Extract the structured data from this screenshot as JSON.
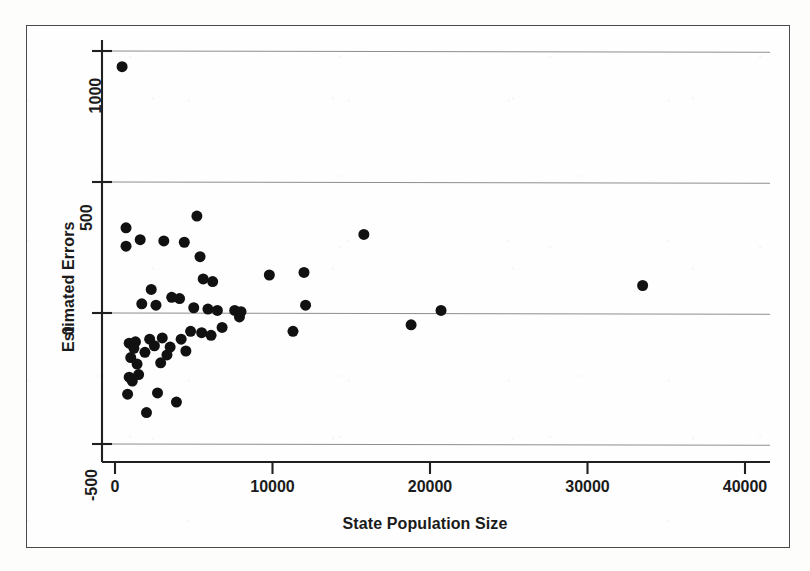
{
  "chart_data": {
    "type": "scatter",
    "title": "",
    "xlabel": "State Population Size",
    "ylabel": "Estimated Errors",
    "xlim": [
      -500,
      41000
    ],
    "ylim": [
      -600,
      1060
    ],
    "xticks": [
      0,
      10000,
      20000,
      30000,
      40000
    ],
    "xtick_labels": [
      "0",
      "10000",
      "20000",
      "30000",
      "40000"
    ],
    "yticks": [
      -500,
      0,
      500,
      1000
    ],
    "ytick_labels": [
      "-500",
      "0",
      "500",
      "1000"
    ],
    "grid": "horizontal",
    "legend": "none",
    "marker": "filled-circle",
    "marker_color": "#111111",
    "marker_size_px": 11,
    "points": [
      {
        "x": 450,
        "y": 940
      },
      {
        "x": 700,
        "y": 325
      },
      {
        "x": 700,
        "y": 255
      },
      {
        "x": 1600,
        "y": 280
      },
      {
        "x": 3100,
        "y": 275
      },
      {
        "x": 4400,
        "y": 270
      },
      {
        "x": 5200,
        "y": 370
      },
      {
        "x": 5400,
        "y": 215
      },
      {
        "x": 15800,
        "y": 300
      },
      {
        "x": 33500,
        "y": 105
      },
      {
        "x": 5600,
        "y": 130
      },
      {
        "x": 6200,
        "y": 120
      },
      {
        "x": 9800,
        "y": 145
      },
      {
        "x": 12000,
        "y": 155
      },
      {
        "x": 2300,
        "y": 90
      },
      {
        "x": 3600,
        "y": 60
      },
      {
        "x": 4100,
        "y": 55
      },
      {
        "x": 1700,
        "y": 35
      },
      {
        "x": 2600,
        "y": 30
      },
      {
        "x": 5000,
        "y": 20
      },
      {
        "x": 5900,
        "y": 15
      },
      {
        "x": 6500,
        "y": 10
      },
      {
        "x": 7600,
        "y": 10
      },
      {
        "x": 7900,
        "y": -15
      },
      {
        "x": 8000,
        "y": 5
      },
      {
        "x": 12100,
        "y": 30
      },
      {
        "x": 18800,
        "y": -45
      },
      {
        "x": 20700,
        "y": 10
      },
      {
        "x": 11300,
        "y": -70
      },
      {
        "x": 900,
        "y": -115
      },
      {
        "x": 1300,
        "y": -110
      },
      {
        "x": 1200,
        "y": -135
      },
      {
        "x": 1000,
        "y": -170
      },
      {
        "x": 1900,
        "y": -150
      },
      {
        "x": 2200,
        "y": -100
      },
      {
        "x": 2500,
        "y": -125
      },
      {
        "x": 3000,
        "y": -95
      },
      {
        "x": 3300,
        "y": -160
      },
      {
        "x": 3500,
        "y": -130
      },
      {
        "x": 4200,
        "y": -100
      },
      {
        "x": 4500,
        "y": -145
      },
      {
        "x": 4800,
        "y": -70
      },
      {
        "x": 5500,
        "y": -75
      },
      {
        "x": 6100,
        "y": -85
      },
      {
        "x": 6800,
        "y": -55
      },
      {
        "x": 900,
        "y": -245
      },
      {
        "x": 1100,
        "y": -260
      },
      {
        "x": 1500,
        "y": -235
      },
      {
        "x": 800,
        "y": -310
      },
      {
        "x": 2700,
        "y": -305
      },
      {
        "x": 3900,
        "y": -340
      },
      {
        "x": 2000,
        "y": -380
      },
      {
        "x": 1400,
        "y": -195
      },
      {
        "x": 2900,
        "y": -190
      }
    ]
  },
  "axis": {
    "x_tick_labels": [
      "0",
      "10000",
      "20000",
      "30000",
      "40000"
    ],
    "y_tick_labels": [
      "1000",
      "500",
      "0",
      "-500"
    ],
    "x_title": "State Population Size",
    "y_title": "Estimated Errors"
  },
  "colors": {
    "marker": "#111111",
    "axis": "#202020",
    "grid": "#8e8e8e",
    "frame": "#4a4a4a",
    "background": "#fefefe"
  }
}
